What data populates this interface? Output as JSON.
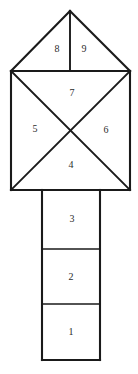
{
  "figure": {
    "canvas": {
      "width": 138,
      "height": 374
    },
    "colors": {
      "background": "#ffffff",
      "stroke": "#1a1a1a",
      "fill": "#ffffff",
      "label_text": "#2b2b2b"
    },
    "geometry": {
      "apex": {
        "x": 70,
        "y": 11
      },
      "square": {
        "left": 11,
        "top": 71,
        "right": 130,
        "bottom": 190
      },
      "stem": {
        "left": 42,
        "right": 100,
        "top": 190,
        "bottom": 360
      },
      "stem_dividers": [
        249,
        304
      ],
      "roof_center_x": 70
    },
    "regions": [
      {
        "id": "1",
        "label": "1",
        "shape": "rectangle",
        "part": "stem-bottom",
        "cx": 71,
        "cy": 332
      },
      {
        "id": "2",
        "label": "2",
        "shape": "rectangle",
        "part": "stem-middle",
        "cx": 71,
        "cy": 277
      },
      {
        "id": "3",
        "label": "3",
        "shape": "rectangle",
        "part": "stem-top",
        "cx": 72,
        "cy": 219
      },
      {
        "id": "4",
        "label": "4",
        "shape": "triangle",
        "part": "square-bottom",
        "cx": 71,
        "cy": 165
      },
      {
        "id": "5",
        "label": "5",
        "shape": "triangle",
        "part": "square-left",
        "cx": 35,
        "cy": 129
      },
      {
        "id": "6",
        "label": "6",
        "shape": "triangle",
        "part": "square-right",
        "cx": 106,
        "cy": 130
      },
      {
        "id": "7",
        "label": "7",
        "shape": "triangle",
        "part": "square-top",
        "cx": 72,
        "cy": 93
      },
      {
        "id": "8",
        "label": "8",
        "shape": "triangle",
        "part": "roof-left",
        "cx": 57,
        "cy": 49
      },
      {
        "id": "9",
        "label": "9",
        "shape": "triangle",
        "part": "roof-right",
        "cx": 84,
        "cy": 49
      }
    ]
  }
}
